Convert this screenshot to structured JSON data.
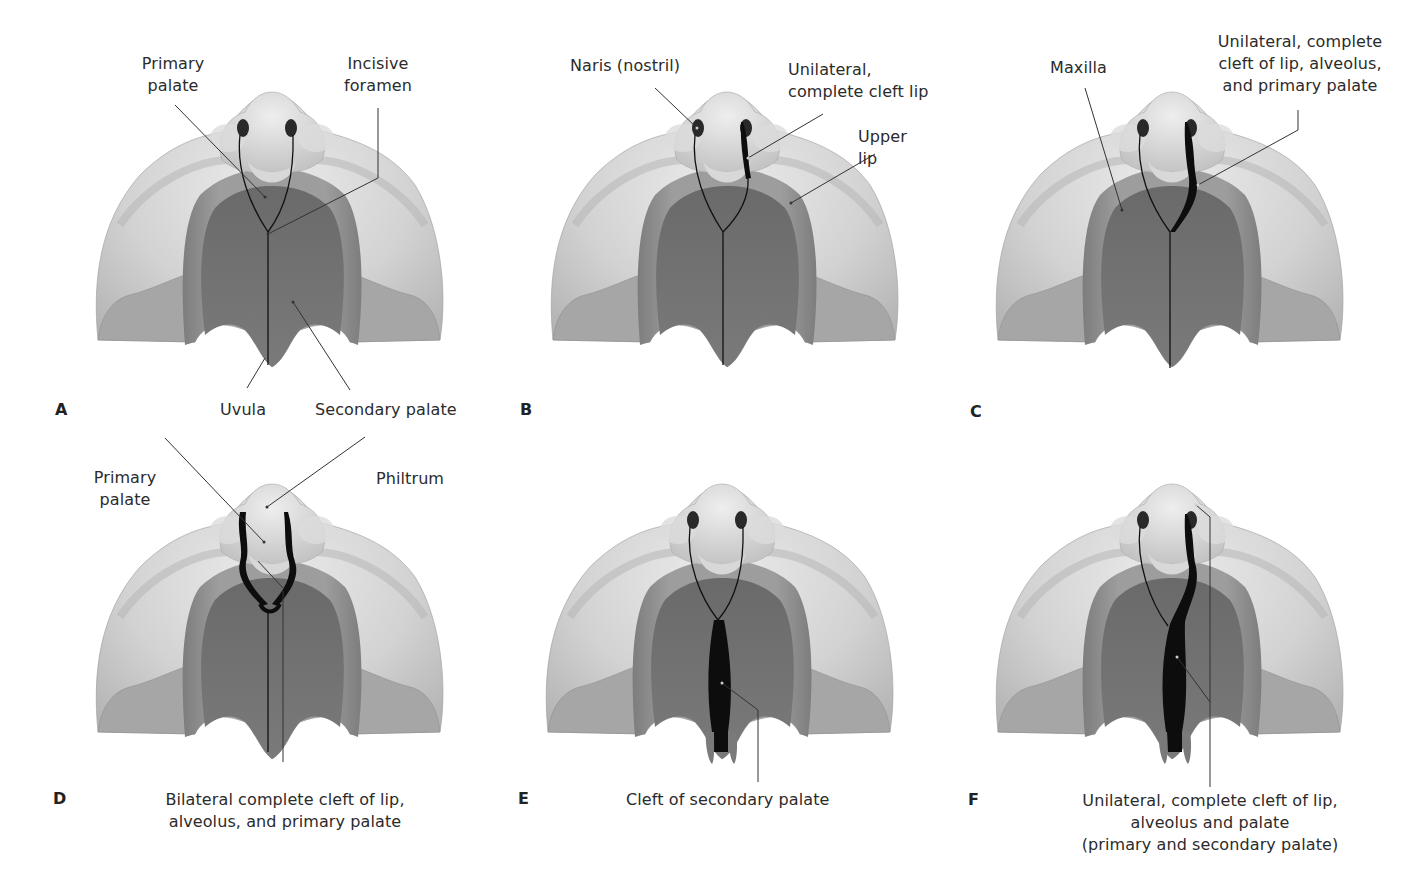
{
  "figure": {
    "colors": {
      "skin_light": "#e6e6e6",
      "skin_mid": "#c9c9c9",
      "skin_shadow": "#a9a9a9",
      "cheek_flap": "#a4a4a4",
      "palate_ridge": "#8e8e8e",
      "palate_dark": "#5f5f5f",
      "cleft": "#0d0d0d",
      "leader_line": "#333333",
      "text": "#2b2b2b"
    }
  },
  "panels": [
    {
      "id": "A",
      "letter": "A",
      "labels": [
        {
          "text": "Primary\npalate",
          "name": "primary-palate"
        },
        {
          "text": "Incisive\nforamen",
          "name": "incisive-foramen"
        },
        {
          "text": "Uvula",
          "name": "uvula"
        },
        {
          "text": "Secondary palate",
          "name": "secondary-palate"
        }
      ]
    },
    {
      "id": "B",
      "letter": "B",
      "labels": [
        {
          "text": "Naris (nostril)",
          "name": "naris"
        },
        {
          "text": "Unilateral,\ncomplete cleft lip",
          "name": "unilateral-complete-cleft-lip"
        },
        {
          "text": "Upper lip",
          "name": "upper-lip"
        }
      ]
    },
    {
      "id": "C",
      "letter": "C",
      "labels": [
        {
          "text": "Maxilla",
          "name": "maxilla"
        },
        {
          "text": "Unilateral, complete\ncleft of lip, alveolus,\nand primary palate",
          "name": "unilateral-cleft-lip-alveolus-primary-palate"
        }
      ]
    },
    {
      "id": "D",
      "letter": "D",
      "labels": [
        {
          "text": "Primary\npalate",
          "name": "primary-palate"
        },
        {
          "text": "Philtrum",
          "name": "philtrum"
        },
        {
          "text": "Bilateral complete cleft of lip,\nalveolus, and primary palate",
          "name": "bilateral-complete-cleft"
        }
      ]
    },
    {
      "id": "E",
      "letter": "E",
      "labels": [
        {
          "text": "Cleft  of secondary palate",
          "name": "cleft-of-secondary-palate"
        }
      ]
    },
    {
      "id": "F",
      "letter": "F",
      "labels": [
        {
          "text": "Unilateral, complete cleft of lip,\nalveolus and palate\n(primary and secondary palate)",
          "name": "unilateral-complete-cleft-lip-alveolus-palate"
        }
      ]
    }
  ]
}
